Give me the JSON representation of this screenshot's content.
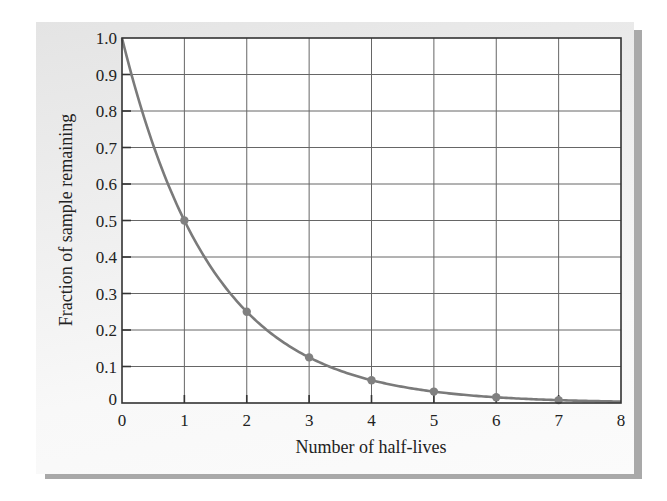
{
  "chart_data": {
    "type": "line",
    "title": "",
    "xlabel": "Number of half-lives",
    "ylabel": "Fraction of sample remaining",
    "xlim": [
      0,
      8
    ],
    "ylim": [
      0,
      1.0
    ],
    "x_ticks": [
      "0",
      "1",
      "2",
      "3",
      "4",
      "5",
      "6",
      "7",
      "8"
    ],
    "y_ticks": [
      "0",
      "0.1",
      "0.2",
      "0.3",
      "0.4",
      "0.5",
      "0.6",
      "0.7",
      "0.8",
      "0.9",
      "1.0"
    ],
    "grid": true,
    "legend": null,
    "series": [
      {
        "name": "Fraction remaining",
        "curve": "exponential decay (0.5^n)",
        "x": [
          0,
          1,
          2,
          3,
          4,
          5,
          6,
          7,
          8
        ],
        "values": [
          1.0,
          0.5,
          0.25,
          0.125,
          0.0625,
          0.03125,
          0.015625,
          0.0078125,
          0.0039
        ],
        "markers_at": [
          1,
          2,
          3,
          4,
          5,
          6,
          7
        ]
      }
    ]
  },
  "colors": {
    "curve": "#7a7a7a",
    "marker": "#808080",
    "grid": "#666666",
    "axis": "#333333",
    "panel": "#ececec",
    "shadow": "#a9a9a9"
  }
}
